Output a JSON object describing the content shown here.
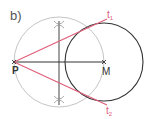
{
  "figure": {
    "label": "b)",
    "points": {
      "P": {
        "label": "P",
        "x": 14,
        "y": 62
      },
      "M": {
        "label": "M",
        "x": 104,
        "y": 62
      }
    },
    "tangents": [
      {
        "label": "t",
        "sub": "1"
      },
      {
        "label": "t",
        "sub": "2"
      }
    ],
    "colors": {
      "tangent": "#e0607a",
      "circle": "#333333",
      "thales": "#b8b8b8",
      "construction": "#444444",
      "text": "#444444"
    }
  }
}
